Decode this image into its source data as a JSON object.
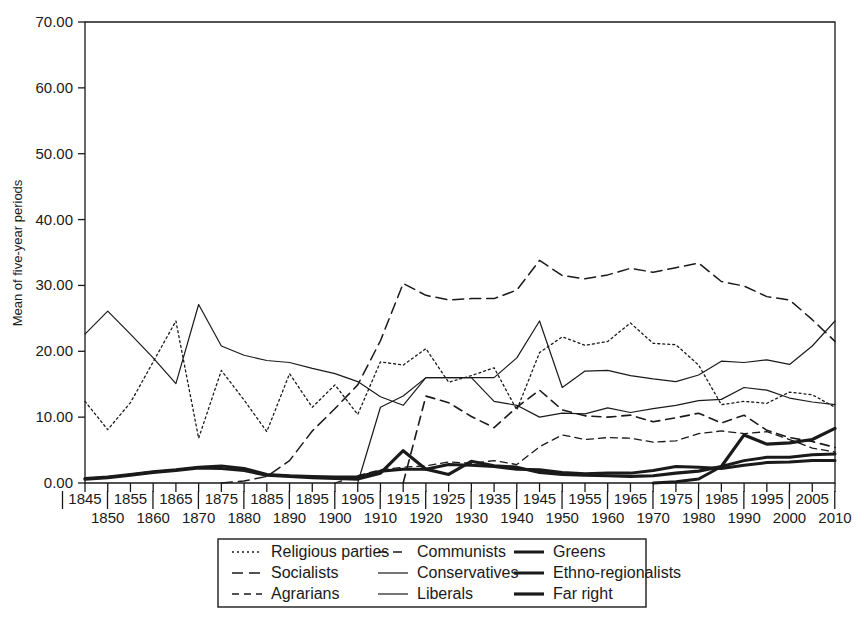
{
  "chart_data": {
    "type": "line",
    "title": "",
    "xlabel": "",
    "ylabel": "Mean of five-year periods",
    "xlim": [
      1845,
      2010
    ],
    "ylim": [
      0,
      70
    ],
    "grid": false,
    "legend_position": "bottom",
    "y_ticks": [
      "0.00",
      "10.00",
      "20.00",
      "30.00",
      "40.00",
      "50.00",
      "60.00",
      "70.00"
    ],
    "y_tick_values": [
      0,
      10,
      20,
      30,
      40,
      50,
      60,
      70
    ],
    "x_ticks_upper": [
      "1845",
      "1855",
      "1865",
      "1875",
      "1885",
      "1895",
      "1905",
      "1915",
      "1925",
      "1935",
      "1945",
      "1955",
      "1965",
      "1975",
      "1985",
      "1995",
      "2005"
    ],
    "x_ticks_lower": [
      "1850",
      "1860",
      "1870",
      "1880",
      "1890",
      "1900",
      "1910",
      "1920",
      "1930",
      "1940",
      "1950",
      "1960",
      "1970",
      "1980",
      "1990",
      "2000",
      "2010"
    ],
    "x": [
      1845,
      1850,
      1855,
      1860,
      1865,
      1870,
      1875,
      1880,
      1885,
      1890,
      1895,
      1900,
      1905,
      1910,
      1915,
      1920,
      1925,
      1930,
      1935,
      1940,
      1945,
      1950,
      1955,
      1960,
      1965,
      1970,
      1975,
      1980,
      1985,
      1990,
      1995,
      2000,
      2005,
      2010
    ],
    "series": [
      {
        "name": "Religious parties",
        "dash": "2,3",
        "width": 1.3,
        "values": [
          12.4,
          8.1,
          12.2,
          18.4,
          24.6,
          6.8,
          17.1,
          12.6,
          7.8,
          16.6,
          11.5,
          14.9,
          10.4,
          18.4,
          17.9,
          20.4,
          15.3,
          16.3,
          17.5,
          11.1,
          19.8,
          22.2,
          20.9,
          21.5,
          24.3,
          21.2,
          21.0,
          17.9,
          11.9,
          12.4,
          12.1,
          13.8,
          13.4,
          11.5
        ]
      },
      {
        "name": "Socialists",
        "dash": "11,6",
        "width": 1.5,
        "values": [
          0.0,
          0.0,
          0.0,
          0.0,
          0.0,
          0.0,
          0.0,
          0.3,
          1.0,
          3.4,
          7.9,
          11.3,
          14.9,
          21.6,
          30.3,
          28.5,
          27.8,
          28.0,
          28.0,
          29.3,
          33.8,
          31.5,
          31.0,
          31.6,
          32.6,
          32.0,
          32.7,
          33.4,
          30.6,
          29.9,
          28.3,
          27.8,
          24.8,
          21.5
        ]
      },
      {
        "name": "Agrarians",
        "dash": "7,5",
        "width": 1.3,
        "values": [
          0.0,
          0.0,
          0.0,
          0.0,
          0.0,
          0.0,
          0.0,
          0.0,
          0.0,
          0.0,
          0.0,
          0.0,
          1.1,
          2.0,
          2.4,
          2.6,
          3.2,
          3.0,
          3.4,
          2.8,
          5.5,
          7.3,
          6.6,
          6.9,
          6.8,
          6.2,
          6.4,
          7.5,
          7.9,
          7.5,
          7.8,
          6.6,
          5.3,
          4.7
        ]
      },
      {
        "name": "Communists",
        "dash": "9,6",
        "width": 1.6,
        "values": [
          0.0,
          0.0,
          0.0,
          0.0,
          0.0,
          0.0,
          0.0,
          0.0,
          0.0,
          0.0,
          0.0,
          0.0,
          0.0,
          0.0,
          0.0,
          13.2,
          12.2,
          10.1,
          8.4,
          11.5,
          14.1,
          11.1,
          10.2,
          10.0,
          10.3,
          9.3,
          9.9,
          10.6,
          9.1,
          10.3,
          8.0,
          6.9,
          6.3,
          5.4
        ]
      },
      {
        "name": "Conservatives",
        "dash": "",
        "width": 1.2,
        "values": [
          0.0,
          0.0,
          0.0,
          0.0,
          0.0,
          0.0,
          0.0,
          0.0,
          0.0,
          0.0,
          0.0,
          0.0,
          0.0,
          11.5,
          13.2,
          16.0,
          16.0,
          16.0,
          16.0,
          19.0,
          24.6,
          14.5,
          17.0,
          17.1,
          16.3,
          15.8,
          15.4,
          16.4,
          18.5,
          18.3,
          18.7,
          18.0,
          20.8,
          24.6
        ]
      },
      {
        "name": "Liberals",
        "dash": "",
        "width": 1.2,
        "values": [
          22.6,
          26.1,
          22.6,
          19.0,
          15.1,
          27.1,
          20.8,
          19.4,
          18.6,
          18.3,
          17.4,
          16.6,
          15.4,
          13.1,
          11.8,
          16.0,
          16.0,
          16.0,
          12.4,
          11.8,
          10.0,
          10.6,
          10.5,
          11.4,
          10.7,
          11.3,
          11.8,
          12.5,
          12.7,
          14.5,
          14.1,
          12.9,
          12.3,
          11.9
        ]
      },
      {
        "name": "Greens",
        "dash": "",
        "width": 3.0,
        "values": [
          0.0,
          0.0,
          0.0,
          0.0,
          0.0,
          0.0,
          0.0,
          0.0,
          0.0,
          0.0,
          0.0,
          0.0,
          0.0,
          0.0,
          0.0,
          0.0,
          0.0,
          0.0,
          0.0,
          0.0,
          0.0,
          0.0,
          0.0,
          0.0,
          0.0,
          0.0,
          0.2,
          0.6,
          2.5,
          3.4,
          3.9,
          3.9,
          4.3,
          4.4
        ]
      },
      {
        "name": "Ethno-regionalists",
        "dash": "",
        "width": 3.0,
        "values": [
          0.7,
          0.9,
          1.3,
          1.7,
          2.0,
          2.4,
          2.6,
          2.2,
          1.3,
          1.1,
          1.0,
          0.9,
          0.9,
          1.8,
          2.1,
          2.1,
          2.8,
          2.7,
          2.5,
          2.1,
          2.0,
          1.6,
          1.4,
          1.5,
          1.5,
          1.9,
          2.5,
          2.4,
          2.2,
          2.7,
          3.1,
          3.2,
          3.4,
          3.4
        ]
      },
      {
        "name": "Far right",
        "dash": "",
        "width": 3.2,
        "values": [
          0.6,
          0.8,
          1.2,
          1.6,
          1.9,
          2.3,
          2.2,
          1.9,
          1.2,
          1.0,
          0.8,
          0.7,
          0.6,
          1.5,
          4.9,
          2.1,
          1.3,
          3.3,
          2.6,
          2.4,
          1.6,
          1.3,
          1.2,
          1.1,
          1.0,
          1.1,
          1.5,
          1.8,
          2.5,
          7.3,
          5.9,
          6.1,
          6.6,
          8.3
        ]
      }
    ]
  },
  "legend": {
    "rows": [
      [
        {
          "name": "Religious parties",
          "dash": "2,3",
          "width": 1.3
        },
        {
          "name": "Communists",
          "dash": "9,6",
          "width": 1.6
        },
        {
          "name": "Greens",
          "dash": "",
          "width": 3.0
        }
      ],
      [
        {
          "name": "Socialists",
          "dash": "11,6",
          "width": 1.5
        },
        {
          "name": "Conservatives",
          "dash": "",
          "width": 1.2
        },
        {
          "name": "Ethno-regionalists",
          "dash": "",
          "width": 3.0
        }
      ],
      [
        {
          "name": "Agrarians",
          "dash": "7,5",
          "width": 1.3
        },
        {
          "name": "Liberals",
          "dash": "",
          "width": 1.2
        },
        {
          "name": "Far right",
          "dash": "",
          "width": 3.2
        }
      ]
    ]
  },
  "colors": {
    "ink": "#1a1a1a",
    "background": "#ffffff"
  }
}
